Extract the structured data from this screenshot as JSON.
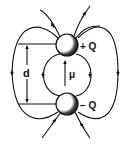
{
  "diagram": {
    "charges": [
      {
        "id": "positive",
        "label": "+ Q"
      },
      {
        "id": "negative",
        "label": "− Q"
      }
    ],
    "separation_label": "d",
    "dipole_moment_label": "μ",
    "colors": {
      "line": "#111111",
      "background": "#ffffff",
      "sphere_shade": "#1a1a1a"
    }
  }
}
